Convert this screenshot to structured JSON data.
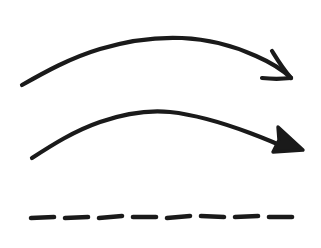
{
  "canvas": {
    "width": 321,
    "height": 248,
    "background_color": "#ffffff",
    "ink_color": "#1a1a1a",
    "description": "Hand-drawn black ink sketch on white background showing three horizontal marks"
  },
  "marks": [
    {
      "id": "curved-arrow-open-head",
      "name": "Top curved arrow with open V arrowhead",
      "type": "arrow",
      "head_style": "open-v",
      "color": "#1a1a1a",
      "stroke_width": 4.2,
      "start_point": [
        22,
        85
      ],
      "apex_point": [
        180,
        38
      ],
      "end_point": [
        292,
        78
      ],
      "shaft_path": "M22,85 C45,72 70,58 100,49 C130,40 158,37 182,38 C208,39 234,46 256,56 C272,63 284,71 291,78",
      "barb_upper_path": "M272,51 C277,59 283,69 291,78",
      "barb_lower_path": "M262,78 C271,79 282,79 291,78"
    },
    {
      "id": "curved-arrow-solid-head",
      "name": "Middle curved arrow with solid filled triangular arrowhead",
      "type": "arrow",
      "head_style": "solid-triangle",
      "color": "#1a1a1a",
      "stroke_width": 4.2,
      "start_point": [
        32,
        158
      ],
      "apex_point": [
        166,
        112
      ],
      "end_point": [
        301,
        150
      ],
      "shaft_path": "M32,158 C52,145 74,131 100,122 C126,113 150,110 170,112 C198,115 226,124 250,133 C266,139 280,145 288,149",
      "head_polygon": "278,127 303,150 273,152 279,140"
    },
    {
      "id": "dashed-line",
      "name": "Bottom dashed horizontal line",
      "type": "dashed-line",
      "color": "#1a1a1a",
      "stroke_width": 4.6,
      "dash_count": 8,
      "y": 217,
      "x_start": 31,
      "x_end": 295,
      "dashes": [
        {
          "x1": 31,
          "y1": 218,
          "x2": 54,
          "y2": 217
        },
        {
          "x1": 65,
          "y1": 218,
          "x2": 88,
          "y2": 217
        },
        {
          "x1": 99,
          "y1": 218,
          "x2": 122,
          "y2": 216
        },
        {
          "x1": 133,
          "y1": 217,
          "x2": 156,
          "y2": 217
        },
        {
          "x1": 167,
          "y1": 218,
          "x2": 190,
          "y2": 216
        },
        {
          "x1": 201,
          "y1": 216,
          "x2": 224,
          "y2": 217
        },
        {
          "x1": 235,
          "y1": 217,
          "x2": 258,
          "y2": 216
        },
        {
          "x1": 269,
          "y1": 217,
          "x2": 292,
          "y2": 217
        }
      ]
    }
  ]
}
